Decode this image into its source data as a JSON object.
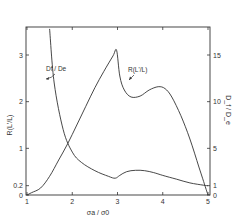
{
  "chart_data": {
    "type": "line",
    "title": "",
    "xlabel": "σa / σ0",
    "ylabel": "R(L'/L)",
    "y2label": "D_f / D_e",
    "xlim": [
      1,
      5
    ],
    "ylim": [
      0,
      3.6
    ],
    "y2lim": [
      0,
      18
    ],
    "xticks": [
      1,
      2,
      3,
      4,
      5
    ],
    "yticks": [
      0,
      0.2,
      1,
      2,
      3
    ],
    "y2ticks": [
      0,
      1,
      5,
      10,
      15
    ],
    "grid": false,
    "legend": "annotations",
    "annotations": [
      {
        "text": "Df / De",
        "x": 1.85,
        "y": 2.9
      },
      {
        "text": "R(L'/L)",
        "x": 3.4,
        "y": 2.55
      }
    ],
    "series": [
      {
        "name": "R(L'/L)",
        "axis": "left",
        "x": [
          1.0,
          1.1,
          1.3,
          1.5,
          1.7,
          1.9,
          2.1,
          2.3,
          2.5,
          2.7,
          2.9,
          2.98,
          3.05,
          3.15,
          3.3,
          3.5,
          3.7,
          3.9,
          4.05,
          4.2,
          4.4,
          4.6,
          4.8,
          4.95,
          5.0
        ],
        "values": [
          0.0,
          0.05,
          0.15,
          0.4,
          0.75,
          1.1,
          1.5,
          1.9,
          2.3,
          2.65,
          2.98,
          3.1,
          2.55,
          2.25,
          2.1,
          2.12,
          2.25,
          2.32,
          2.28,
          2.1,
          1.7,
          1.2,
          0.6,
          0.15,
          0.0
        ]
      },
      {
        "name": "Df / De",
        "axis": "right",
        "x": [
          1.5,
          1.6,
          1.8,
          2.0,
          2.2,
          2.5,
          2.8,
          2.95,
          3.05,
          3.2,
          3.4,
          3.6,
          3.8,
          4.0,
          4.3,
          4.6,
          4.9,
          5.0
        ],
        "values": [
          17.8,
          12.0,
          7.0,
          4.6,
          3.5,
          2.6,
          2.0,
          1.8,
          2.1,
          2.5,
          2.65,
          2.6,
          2.4,
          2.1,
          1.7,
          1.3,
          1.05,
          1.0
        ]
      }
    ]
  }
}
